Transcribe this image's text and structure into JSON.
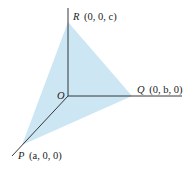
{
  "diagram": {
    "type": "3d-coordinate-plane",
    "fill_color": "#cde6f3",
    "line_color": "#222222",
    "origin": {
      "label": "O"
    },
    "points": [
      {
        "name": "R",
        "coords": "(0, 0, c)"
      },
      {
        "name": "Q",
        "coords": "(0, b, 0)"
      },
      {
        "name": "P",
        "coords": "(a, 0, 0)"
      }
    ]
  }
}
